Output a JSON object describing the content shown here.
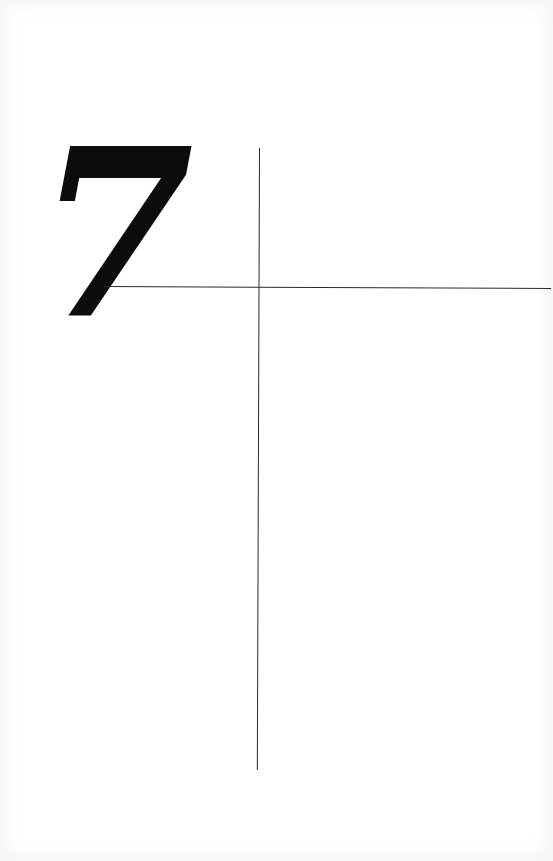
{
  "page": {
    "number": "7",
    "background_color": "#ffffff",
    "ink_color": "#0c0c0c",
    "rule_color": "#2a2a2a"
  }
}
